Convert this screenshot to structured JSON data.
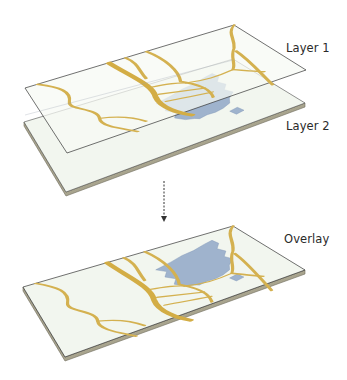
{
  "labels": {
    "layer1": "Layer 1",
    "layer2": "Layer 2",
    "overlay": "Overlay"
  },
  "colors": {
    "background": "#ffffff",
    "slab_surface": "#f2f6ef",
    "slab_edge": "#a8a48e",
    "slab_edge_dark": "#7d7a68",
    "outline": "#3a3a3a",
    "road": "#d3ad45",
    "road_outline": "#b8923a",
    "water": "#9db1cc",
    "water_light": "#c9d4e2",
    "arrow": "#333333"
  },
  "layers": [
    {
      "id": "layer1",
      "name": "Layer 1",
      "content": "roads (transparent sheet)"
    },
    {
      "id": "layer2",
      "name": "Layer 2",
      "content": "water body (base slab)"
    },
    {
      "id": "overlay",
      "name": "Overlay",
      "content": "roads + water body combined"
    }
  ],
  "arrow": {
    "direction": "down",
    "style": "dashed"
  }
}
